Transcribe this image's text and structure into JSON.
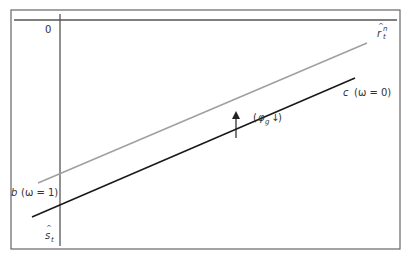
{
  "diagram": {
    "type": "line-diagram",
    "axes": {
      "origin_label": "0",
      "horizontal_axis_label_base": "r",
      "horizontal_axis_label_sup": "n",
      "horizontal_axis_label_sub": "t",
      "vertical_axis_label_base": "s",
      "vertical_axis_label_sub": "t"
    },
    "lines": [
      {
        "id": "b",
        "label_letter": "b",
        "label_param": "(ω = 1)",
        "color": "#a0a0a0",
        "x1": 38,
        "y1": 183,
        "x2": 367,
        "y2": 43
      },
      {
        "id": "c",
        "label_letter": "c",
        "label_param": "(ω = 0)",
        "color": "#1a1a1a",
        "x1": 32,
        "y1": 217,
        "x2": 355,
        "y2": 78
      }
    ],
    "shift_annotation": {
      "text_open": "(",
      "symbol": "φ",
      "subscript": "g",
      "arrow": "↓",
      "text_close": ")",
      "direction": "up"
    },
    "colors": {
      "frame": "#555555",
      "axis": "#555555",
      "text": "#333333"
    }
  }
}
